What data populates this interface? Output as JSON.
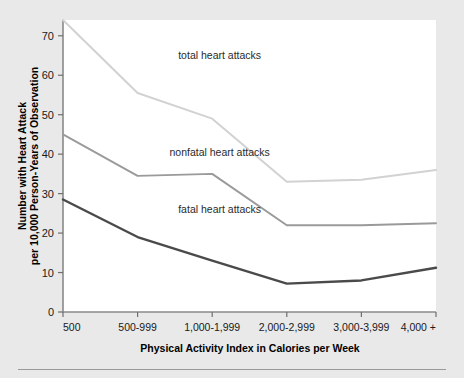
{
  "chart_data": {
    "type": "line",
    "title": "",
    "xlabel": "Physical Activity Index in Calories per Week",
    "ylabel": "Number with Heart Attack per 10,000 Person-Years of Observation",
    "ylabel_line1": "Number with Heart Attack",
    "ylabel_line2": "per 10,000 Person-Years of Observation",
    "categories": [
      "500",
      "500-999",
      "1,000-1,999",
      "2,000-2,999",
      "3,000-3,999",
      "4,000 +"
    ],
    "ylim": [
      0,
      74
    ],
    "yticks": [
      0,
      10,
      20,
      30,
      40,
      50,
      60,
      70
    ],
    "ytick_labels": [
      "0",
      "10",
      "20",
      "30",
      "40",
      "50",
      "60",
      "70"
    ],
    "grid": false,
    "legend_position": "inline-annotations",
    "series": [
      {
        "name": "total heart attacks",
        "label": "total heart attacks",
        "color": "#d2d2d2",
        "values": [
          74,
          55.5,
          49,
          33,
          33.5,
          36
        ]
      },
      {
        "name": "nonfatal heart attacks",
        "label": "nonfatal heart attacks",
        "color": "#9a9a9a",
        "values": [
          45,
          34.5,
          35,
          22,
          22,
          22.5
        ]
      },
      {
        "name": "fatal heart attacks",
        "label": "fatal heart attacks",
        "color": "#4a4a4a",
        "values": [
          28.5,
          19,
          13,
          7.2,
          8,
          11.2
        ]
      }
    ],
    "annotations": [
      {
        "text": "total heart attacks",
        "x": 0.42,
        "y": 64
      },
      {
        "text": "nonfatal heart attacks",
        "x": 0.42,
        "y": 39.5
      },
      {
        "text": "fatal heart attacks",
        "x": 0.42,
        "y": 25
      }
    ]
  },
  "colors": {
    "page_background": "#e9e9e9",
    "plot_background": "#ffffff",
    "axis": "#8a8a8a",
    "text": "#1a1a1a",
    "total_series": "#d2d2d2",
    "nonfatal_series": "#9a9a9a",
    "fatal_series": "#4a4a4a",
    "footer_rule": "#9a9a9a"
  }
}
